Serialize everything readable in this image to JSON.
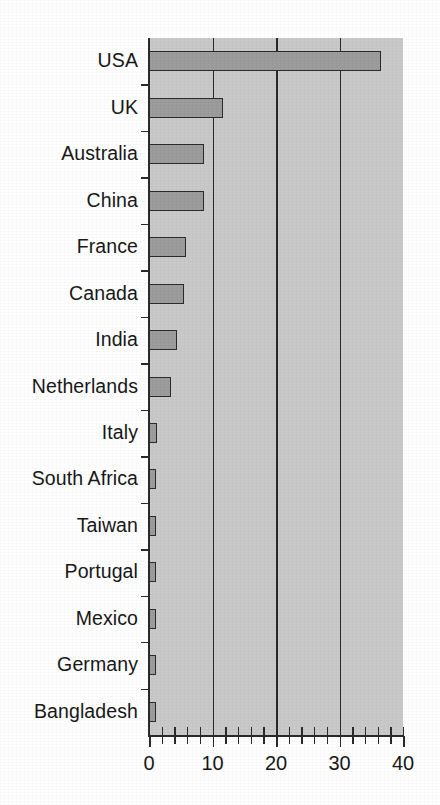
{
  "chart_data": {
    "type": "bar",
    "orientation": "horizontal",
    "title": "",
    "subtitle": "",
    "xlabel": "",
    "ylabel": "",
    "categories": [
      "USA",
      "UK",
      "Australia",
      "China",
      "France",
      "Canada",
      "India",
      "Netherlands",
      "Italy",
      "South Africa",
      "Taiwan",
      "Portugal",
      "Mexico",
      "Germany",
      "Bangladesh"
    ],
    "values": [
      36.5,
      11.6,
      8.6,
      8.6,
      5.9,
      5.5,
      4.4,
      3.4,
      1.2,
      0.8,
      0.8,
      0.8,
      0.8,
      0.8,
      0.8
    ],
    "xlim": [
      0,
      40
    ],
    "xticks": [
      0,
      10,
      20,
      30,
      40
    ],
    "xtick_labels": [
      "0",
      "10",
      "20",
      "30",
      "40"
    ],
    "x_minor_tick_interval": 2,
    "gridlines": [
      10,
      20,
      30
    ],
    "grid": true,
    "legend": null,
    "legend_position": "none",
    "bar_color": "#9c9c9c",
    "bar_edge_color": "#2b2b2b",
    "plot_background": "#c9c9c9",
    "axis_color": "#2a2a2a",
    "page_background": "#ffffff"
  },
  "geometry": {
    "plot_left": 149,
    "plot_right": 403,
    "plot_top": 38,
    "plot_bottom": 735,
    "bar_thickness": 20,
    "row_height": 46.47
  }
}
